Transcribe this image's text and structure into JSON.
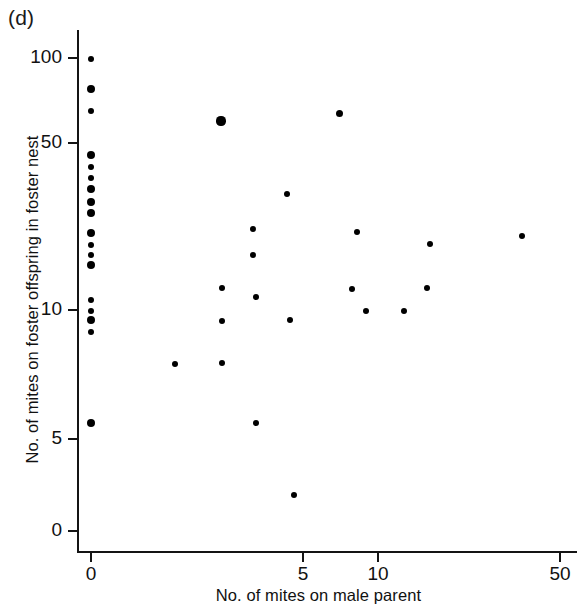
{
  "figure": {
    "panel_label": "(d)",
    "x_axis_label": "No. of mites on male parent",
    "y_axis_label": "No. of mites on foster offspring in foster nest",
    "ink_color": "#000000",
    "background_color": "#ffffff"
  },
  "chart_data": {
    "type": "scatter",
    "title": "(d)",
    "xlabel": "No. of mites on male parent",
    "ylabel": "No. of mites on foster offspring in foster nest",
    "grid": false,
    "legend": null,
    "xscale": "log-like",
    "yscale": "log-like",
    "xticks": [
      0,
      5,
      10,
      50
    ],
    "xticklabels": [
      "0",
      "5",
      "10",
      "50"
    ],
    "yticks": [
      0,
      5,
      10,
      50,
      100
    ],
    "yticklabels": [
      "0",
      "5",
      "10",
      "50",
      "100"
    ],
    "xlim": [
      0,
      50
    ],
    "ylim": [
      0,
      115
    ],
    "n_points": 42,
    "points": [
      {
        "x": 0,
        "y": 100
      },
      {
        "x": 0,
        "y": 80
      },
      {
        "x": 0,
        "y": 65
      },
      {
        "x": 0,
        "y": 44
      },
      {
        "x": 0,
        "y": 40
      },
      {
        "x": 0,
        "y": 37
      },
      {
        "x": 0,
        "y": 34
      },
      {
        "x": 0,
        "y": 31
      },
      {
        "x": 0,
        "y": 29
      },
      {
        "x": 0,
        "y": 24
      },
      {
        "x": 0,
        "y": 22
      },
      {
        "x": 0,
        "y": 20
      },
      {
        "x": 0,
        "y": 18
      },
      {
        "x": 0,
        "y": 11
      },
      {
        "x": 0,
        "y": 10
      },
      {
        "x": 0,
        "y": 9.5
      },
      {
        "x": 0,
        "y": 8.8
      },
      {
        "x": 0,
        "y": 4.1
      },
      {
        "x": 1.8,
        "y": 6.8
      },
      {
        "x": 3.0,
        "y": 58
      },
      {
        "x": 3.0,
        "y": 11.5
      },
      {
        "x": 3.0,
        "y": 9.3
      },
      {
        "x": 3.0,
        "y": 6.9
      },
      {
        "x": 3.6,
        "y": 23
      },
      {
        "x": 3.6,
        "y": 17
      },
      {
        "x": 3.7,
        "y": 10.5
      },
      {
        "x": 3.7,
        "y": 4.1
      },
      {
        "x": 4.3,
        "y": 30
      },
      {
        "x": 4.4,
        "y": 9.3
      },
      {
        "x": 4.5,
        "y": 1.3
      },
      {
        "x": 6.9,
        "y": 62
      },
      {
        "x": 8.2,
        "y": 11.4
      },
      {
        "x": 8.4,
        "y": 22
      },
      {
        "x": 9.4,
        "y": 10
      },
      {
        "x": 10.6,
        "y": 10
      },
      {
        "x": 11.6,
        "y": 11.4
      },
      {
        "x": 11.8,
        "y": 19
      },
      {
        "x": 14.0,
        "y": 21
      }
    ]
  },
  "axes": {
    "y_ticks": [
      {
        "label": "100",
        "px": 58
      },
      {
        "label": "50",
        "px": 143
      },
      {
        "label": "10",
        "px": 310
      },
      {
        "label": "5",
        "px": 439
      },
      {
        "label": "0",
        "px": 531
      }
    ],
    "x_ticks": [
      {
        "label": "0",
        "px": 91
      },
      {
        "label": "5",
        "px": 303
      },
      {
        "label": "10",
        "px": 378
      },
      {
        "label": "50",
        "px": 560
      }
    ]
  },
  "rendered_points": [
    {
      "px": 91,
      "py": 59,
      "r": 3.0
    },
    {
      "px": 91,
      "py": 89,
      "r": 4.2
    },
    {
      "px": 91,
      "py": 111,
      "r": 3.2
    },
    {
      "px": 91,
      "py": 155,
      "r": 4.4
    },
    {
      "px": 91,
      "py": 167,
      "r": 3.2
    },
    {
      "px": 91,
      "py": 178,
      "r": 3.4
    },
    {
      "px": 91,
      "py": 189,
      "r": 4.4
    },
    {
      "px": 91,
      "py": 202,
      "r": 4.4
    },
    {
      "px": 91,
      "py": 213,
      "r": 4.4
    },
    {
      "px": 91,
      "py": 233,
      "r": 4.4
    },
    {
      "px": 91,
      "py": 245,
      "r": 3.3
    },
    {
      "px": 91,
      "py": 255,
      "r": 3.3
    },
    {
      "px": 91,
      "py": 265,
      "r": 4.4
    },
    {
      "px": 91,
      "py": 300,
      "r": 3.2
    },
    {
      "px": 91,
      "py": 311,
      "r": 3.4
    },
    {
      "px": 91,
      "py": 320,
      "r": 4.2
    },
    {
      "px": 91,
      "py": 332,
      "r": 3.2
    },
    {
      "px": 91,
      "py": 423,
      "r": 4.4
    },
    {
      "px": 175,
      "py": 364,
      "r": 3.3
    },
    {
      "px": 221,
      "py": 121,
      "r": 4.6
    },
    {
      "px": 222,
      "py": 288,
      "r": 3.4
    },
    {
      "px": 222,
      "py": 321,
      "r": 3.4
    },
    {
      "px": 222,
      "py": 363,
      "r": 3.4
    },
    {
      "px": 253,
      "py": 229,
      "r": 3.3
    },
    {
      "px": 253,
      "py": 255,
      "r": 3.3
    },
    {
      "px": 256,
      "py": 297,
      "r": 3.3
    },
    {
      "px": 256,
      "py": 423,
      "r": 3.3
    },
    {
      "px": 287,
      "py": 194,
      "r": 3.4
    },
    {
      "px": 290,
      "py": 320,
      "r": 3.3
    },
    {
      "px": 294,
      "py": 495,
      "r": 3.3
    },
    {
      "px": 339,
      "py": 113,
      "r": 3.5
    },
    {
      "px": 352,
      "py": 289,
      "r": 3.4
    },
    {
      "px": 357,
      "py": 232,
      "r": 3.4
    },
    {
      "px": 366,
      "py": 311,
      "r": 3.3
    },
    {
      "px": 404,
      "py": 311,
      "r": 3.3
    },
    {
      "px": 427,
      "py": 288,
      "r": 3.4
    },
    {
      "px": 430,
      "py": 244,
      "r": 3.4
    },
    {
      "px": 522,
      "py": 236,
      "r": 3.4
    }
  ]
}
